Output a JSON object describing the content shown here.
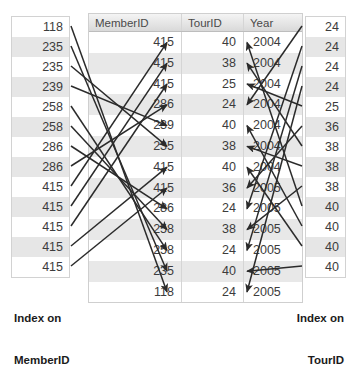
{
  "diagram": {
    "arrow_color": "#2b2b2b"
  },
  "index_left": {
    "caption_line1": "Index on",
    "caption_line2": "MemberID",
    "values": [
      "118",
      "235",
      "235",
      "239",
      "258",
      "258",
      "286",
      "286",
      "415",
      "415",
      "415",
      "415",
      "415"
    ]
  },
  "index_right": {
    "caption_line1": "Index on",
    "caption_line2": "TourID",
    "values": [
      "24",
      "24",
      "24",
      "24",
      "25",
      "36",
      "38",
      "38",
      "38",
      "40",
      "40",
      "40",
      "40"
    ]
  },
  "table": {
    "columns": [
      "MemberID",
      "TourID",
      "Year"
    ],
    "rows": [
      {
        "member": "415",
        "tour": "40",
        "year": "2004"
      },
      {
        "member": "415",
        "tour": "38",
        "year": "2004"
      },
      {
        "member": "415",
        "tour": "25",
        "year": "2004"
      },
      {
        "member": "286",
        "tour": "24",
        "year": "2004"
      },
      {
        "member": "239",
        "tour": "40",
        "year": "2004"
      },
      {
        "member": "235",
        "tour": "38",
        "year": "2004"
      },
      {
        "member": "415",
        "tour": "40",
        "year": "2004"
      },
      {
        "member": "415",
        "tour": "36",
        "year": "2005"
      },
      {
        "member": "286",
        "tour": "24",
        "year": "2005"
      },
      {
        "member": "258",
        "tour": "38",
        "year": "2005"
      },
      {
        "member": "258",
        "tour": "24",
        "year": "2005"
      },
      {
        "member": "235",
        "tour": "40",
        "year": "2005"
      },
      {
        "member": "118",
        "tour": "24",
        "year": "2005"
      }
    ]
  },
  "links_left": [
    {
      "from": 0,
      "to": 12
    },
    {
      "from": 1,
      "to": 11
    },
    {
      "from": 2,
      "to": 5
    },
    {
      "from": 3,
      "to": 4
    },
    {
      "from": 4,
      "to": 10
    },
    {
      "from": 5,
      "to": 9
    },
    {
      "from": 6,
      "to": 8
    },
    {
      "from": 7,
      "to": 3
    },
    {
      "from": 8,
      "to": 0
    },
    {
      "from": 9,
      "to": 1
    },
    {
      "from": 10,
      "to": 2
    },
    {
      "from": 11,
      "to": 6
    },
    {
      "from": 12,
      "to": 7
    }
  ],
  "links_right": [
    {
      "from": 0,
      "to": 3
    },
    {
      "from": 1,
      "to": 8
    },
    {
      "from": 2,
      "to": 10
    },
    {
      "from": 3,
      "to": 12
    },
    {
      "from": 4,
      "to": 2
    },
    {
      "from": 5,
      "to": 7
    },
    {
      "from": 6,
      "to": 1
    },
    {
      "from": 7,
      "to": 5
    },
    {
      "from": 8,
      "to": 9
    },
    {
      "from": 9,
      "to": 0
    },
    {
      "from": 10,
      "to": 4
    },
    {
      "from": 11,
      "to": 6
    },
    {
      "from": 12,
      "to": 11
    }
  ]
}
